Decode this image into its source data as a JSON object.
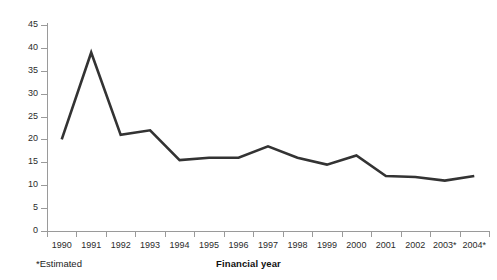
{
  "chart_data": {
    "type": "line",
    "title": "",
    "xlabel": "Financial year",
    "ylabel": "",
    "categories": [
      "1990",
      "1991",
      "1992",
      "1993",
      "1994",
      "1995",
      "1996",
      "1997",
      "1998",
      "1999",
      "2000",
      "2001",
      "2002",
      "2003*",
      "2004*"
    ],
    "values": [
      20,
      39,
      21,
      22,
      15.5,
      16,
      16,
      18.5,
      16,
      14.5,
      16.5,
      12,
      11.8,
      11,
      12
    ],
    "series": [
      {
        "name": "",
        "values": [
          20,
          39,
          21,
          22,
          15.5,
          16,
          16,
          18.5,
          16,
          14.5,
          16.5,
          12,
          11.8,
          11,
          12
        ]
      }
    ],
    "ylim": [
      0,
      45
    ],
    "yticks": [
      0,
      5,
      10,
      15,
      20,
      25,
      30,
      35,
      40,
      45
    ],
    "ytick_labels": [
      "0",
      "5",
      "10",
      "15",
      "20",
      "25",
      "30",
      "35",
      "40",
      "45"
    ],
    "grid": false,
    "legend": "none",
    "line_color": "#333333",
    "axis_color": "#9a9a9a",
    "text_color": "#1c1c1c"
  },
  "footnote": "*Estimated",
  "axis_titles": {
    "x": "Financial year"
  }
}
